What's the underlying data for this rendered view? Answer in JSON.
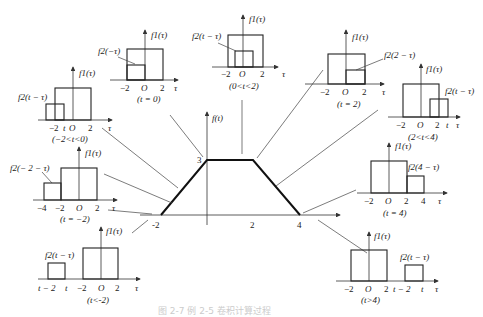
{
  "main_plot": {
    "ylabel": "f(t)",
    "y_peak_label": "3",
    "x_ticks": [
      "-2",
      "2",
      "4"
    ],
    "description": "Trapezoid: rises from (-2,0) to (0,3), flat to (2,3), falls to (4,0)"
  },
  "panels": [
    {
      "id": "t-lt-neg2",
      "condition": "(t<-2)",
      "f1_label": "f1(τ)",
      "f2_label": "f2(t − τ)",
      "ticks": [
        "t − 2",
        "t",
        "−2",
        "O",
        "2",
        "τ"
      ]
    },
    {
      "id": "t-eq-neg2",
      "condition": "(t = −2)",
      "f1_label": "f1(τ)",
      "f2_label": "f2(− 2 − τ)",
      "ticks": [
        "−4",
        "−2",
        "O",
        "2",
        "τ"
      ]
    },
    {
      "id": "neg2-lt-t-lt-0",
      "condition": "(−2<t<0)",
      "f1_label": "f1(τ)",
      "f2_label": "f2(t − τ)",
      "ticks": [
        "−2",
        "t",
        "O",
        "2",
        "τ"
      ]
    },
    {
      "id": "t-eq-0",
      "condition": "(t = 0)",
      "f1_label": "f1(τ)",
      "f2_label": "f2(−τ)",
      "ticks": [
        "−2",
        "O",
        "2",
        "τ"
      ]
    },
    {
      "id": "0-lt-t-lt-2",
      "condition": "(0<t<2)",
      "f1_label": "f1(τ)",
      "f2_label": "f2(t − τ)",
      "ticks": [
        "−2",
        "O",
        "2",
        "τ"
      ]
    },
    {
      "id": "t-eq-2",
      "condition": "(t = 2)",
      "f1_label": "f1(τ)",
      "f2_label": "f2(2 − τ)",
      "ticks": [
        "−2",
        "O",
        "2",
        "τ"
      ]
    },
    {
      "id": "2-lt-t-lt-4",
      "condition": "(2<t<4)",
      "f1_label": "f1(τ)",
      "f2_label": "f2(t − τ)",
      "ticks": [
        "−2",
        "O",
        "2",
        "t",
        "τ"
      ]
    },
    {
      "id": "t-eq-4",
      "condition": "(t = 4)",
      "f1_label": "f1(τ)",
      "f2_label": "f2(4 − τ)",
      "ticks": [
        "−2",
        "O",
        "2",
        "4",
        "τ"
      ]
    },
    {
      "id": "t-gt-4",
      "condition": "(t>4)",
      "f1_label": "f1(τ)",
      "f2_label": "f2(t − τ)",
      "ticks": [
        "−2",
        "O",
        "2",
        "t − 2",
        "t",
        "τ"
      ]
    }
  ],
  "caption": "图 2-7  例 2-5 卷积计算过程"
}
